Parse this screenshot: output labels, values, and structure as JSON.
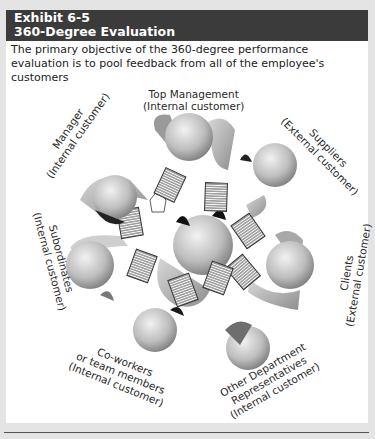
{
  "exhibit": {
    "number": "Exhibit 6-5",
    "title": "360-Degree Evaluation",
    "caption": "The primary objective of the 360-degree performance evaluation is to pool feedback from all of the employee's customers"
  },
  "diagram": {
    "type": "circle-of-people",
    "center": "Employee (being evaluated)",
    "participants": [
      {
        "name": "Top Management",
        "role": "(Internal customer)"
      },
      {
        "name": "Suppliers",
        "role": "(External customer)"
      },
      {
        "name": "Clients",
        "role": "(External customer)"
      },
      {
        "name": "Other Department Representatives",
        "line1": "Other Department",
        "line2": "Representatives",
        "role": "(Internal customer)"
      },
      {
        "name": "Co-workers or team members",
        "line1": "Co-workers",
        "line2": "or team members",
        "role": "(Internal customer)"
      },
      {
        "name": "Subordinates",
        "role": "(Internal customer)"
      },
      {
        "name": "Manager",
        "role": "(Internal customer)"
      }
    ]
  }
}
